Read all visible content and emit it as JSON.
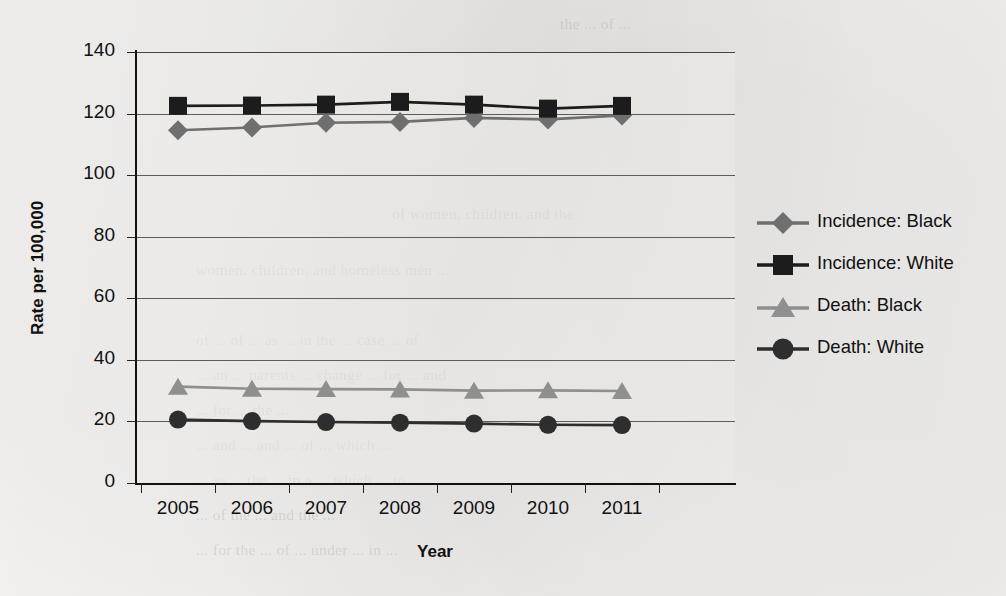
{
  "chart_data": {
    "type": "line",
    "title": "",
    "xlabel": "Year",
    "ylabel": "Rate per 100,000",
    "x": [
      2005,
      2006,
      2007,
      2008,
      2009,
      2010,
      2011
    ],
    "categories": [
      "2005",
      "2006",
      "2007",
      "2008",
      "2009",
      "2010",
      "2011"
    ],
    "xtick_labels": [
      "2005",
      "2006",
      "2007",
      "2008",
      "2009",
      "2010",
      "2011"
    ],
    "ytick_labels": [
      "0",
      "20",
      "40",
      "60",
      "80",
      "100",
      "120",
      "140"
    ],
    "yticks": [
      0,
      20,
      40,
      60,
      80,
      100,
      120,
      140
    ],
    "ylim": [
      0,
      140
    ],
    "grid": "horizontal",
    "legend_position": "right",
    "series": [
      {
        "name": "Incidence: Black",
        "marker": "diamond",
        "color": "#6f6f6f",
        "line_color": "#6f6f6f",
        "values": [
          114.6,
          115.5,
          117.0,
          117.3,
          118.6,
          118.1,
          119.4
        ]
      },
      {
        "name": "Incidence: White",
        "marker": "square",
        "color": "#1c1c1c",
        "line_color": "#1c1c1c",
        "values": [
          122.5,
          122.6,
          122.9,
          123.8,
          122.9,
          121.6,
          122.5
        ]
      },
      {
        "name": "Death: Black",
        "marker": "triangle",
        "color": "#8f8f8f",
        "line_color": "#8f8f8f",
        "values": [
          31.3,
          30.6,
          30.5,
          30.4,
          30.0,
          30.1,
          29.9
        ]
      },
      {
        "name": "Death: White",
        "marker": "circle",
        "color": "#2e2e2e",
        "line_color": "#2e2e2e",
        "values": [
          20.6,
          20.1,
          19.8,
          19.6,
          19.3,
          18.9,
          18.8
        ]
      }
    ]
  },
  "legend": {
    "entries": [
      {
        "label": "Incidence: Black"
      },
      {
        "label": "Incidence: White"
      },
      {
        "label": "Death: Black"
      },
      {
        "label": "Death: White"
      }
    ]
  },
  "axes": {
    "y_title": "Rate per 100,000",
    "x_title": "Year"
  },
  "background_showthrough": {
    "lines": [
      "the ... of ...",
      "of women, children, and the",
      "women, children, and homeless men ...",
      "",
      "of ... of ... as ... in the ... case ... of",
      "... an ... parents ... change ... for ... and",
      "... for ... the ...",
      "... and ... and ... of ... which ...",
      "... as ... the ... in a ... which ... to ...",
      "... of the ... and the ...",
      "...",
      "... for the ... of ... under ... in ..."
    ]
  }
}
